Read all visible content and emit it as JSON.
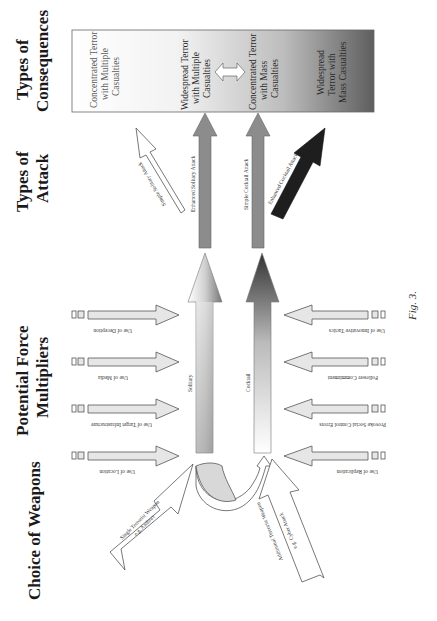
{
  "headers": {
    "choice_of_weapons": "Choice of Weapons",
    "force_multipliers_1": "Potential Force",
    "force_multipliers_2": "Multipliers",
    "types_of_attack_1": "Types of",
    "types_of_attack_2": "Attack",
    "types_of_consequences_1": "Types of",
    "types_of_consequences_2": "Consequences"
  },
  "consequences": {
    "c1": [
      "Concentrated Terror",
      "with Multiple",
      "Casualties"
    ],
    "c2": [
      "Widespread Terror",
      "with Multiple",
      "Casualties"
    ],
    "c3": [
      "Concentrated Terror",
      "with Mass",
      "Casualties"
    ],
    "c4": [
      "Widespread",
      "Terror with",
      "Mass  Casualties"
    ]
  },
  "attacks": {
    "simple_solitary": "Simple Solitary Attack",
    "enhanced_solitary": "Enhanced Solitary Attack",
    "simple_cocktail": "Simple Cocktail Attack",
    "enhanced_cocktail": "Enhanced Cocktail Attack"
  },
  "main_paths": {
    "solitary": "Solitary",
    "cocktail": "Cocktail"
  },
  "multipliers_left": [
    {
      "label": "Use of Deception"
    },
    {
      "label": "Use of Media"
    },
    {
      "label": "Use of Target Infrastructure"
    },
    {
      "label": "Use of Location"
    }
  ],
  "multipliers_right": [
    {
      "label": "Use of Innovative Tactics"
    },
    {
      "label": "Follower Commitment"
    },
    {
      "label": "Provoke Social Control Errors"
    },
    {
      "label": "Use of Replication"
    }
  ],
  "weapons": {
    "single": [
      "Single Terrorist Weapon",
      "e.g. Anthrax"
    ],
    "additional": [
      "Additional Terrorist Weapon",
      "e.g. Cyber Attack"
    ]
  },
  "caption": "Fig. 3.",
  "colors": {
    "grey_arrow": "#8c8c8c",
    "dark_arrow": "#1e1e1e",
    "light_fill": "#e6e6e6",
    "outline": "#555555"
  }
}
